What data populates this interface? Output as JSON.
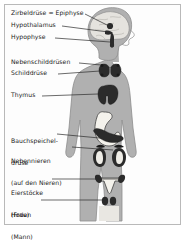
{
  "diagram": {
    "language": "de",
    "body_figure": "human-silhouette-front-with-head-in-profile",
    "colors": {
      "background": "#fdfdfd",
      "frame_border": "#b9b9b9",
      "body_fill": "#b0b0b0",
      "body_outline": "#8a8a8a",
      "organ_dark": "#2b2b2b",
      "organ_light": "#f2f0ea",
      "brain_fill": "#e3e1dc",
      "leader_line": "#2b2b2b",
      "text": "#1a1a1a"
    },
    "labels": [
      {
        "id": "pineal",
        "lines": [
          "Zirbeldrüse = Epiphyse"
        ],
        "organ": "Zirbeldrüse",
        "x": 11,
        "y": 11
      },
      {
        "id": "hypothalamus",
        "lines": [
          "Hypothalamus"
        ],
        "organ": "Hypothalamus",
        "x": 11,
        "y": 23
      },
      {
        "id": "pituitary",
        "lines": [
          "Hypophyse"
        ],
        "organ": "Hypophyse",
        "x": 11,
        "y": 35
      },
      {
        "id": "parathyroid",
        "lines": [
          "Nebenschilddrüsen"
        ],
        "organ": "Nebenschilddrüsen",
        "x": 11,
        "y": 60
      },
      {
        "id": "thyroid",
        "lines": [
          "Schilddrüse"
        ],
        "organ": "Schilddrüse",
        "x": 11,
        "y": 71
      },
      {
        "id": "thymus",
        "lines": [
          "Thymus"
        ],
        "organ": "Thymus",
        "x": 11,
        "y": 93
      },
      {
        "id": "pancreas",
        "lines": [
          "Bauchspeichel-",
          "drüse"
        ],
        "organ": "Bauchspeicheldrüse",
        "x": 11,
        "y": 124
      },
      {
        "id": "adrenal",
        "lines": [
          "Nebennieren",
          "(auf den Nieren)"
        ],
        "organ": "Nebennieren",
        "x": 11,
        "y": 144
      },
      {
        "id": "ovaries",
        "lines": [
          "Eierstöcke",
          "(Frau)"
        ],
        "organ": "Eierstöcke",
        "x": 11,
        "y": 176
      },
      {
        "id": "testes",
        "lines": [
          "Hoden",
          "(Mann)"
        ],
        "organ": "Hoden",
        "x": 11,
        "y": 198
      }
    ],
    "organs": [
      {
        "id": "pineal",
        "label": "Zirbeldrüse = Epiphyse",
        "region": "brain",
        "shade": "dark"
      },
      {
        "id": "hypothalamus",
        "label": "Hypothalamus",
        "region": "brain",
        "shade": "dark"
      },
      {
        "id": "pituitary",
        "label": "Hypophyse",
        "region": "brain",
        "shade": "dark"
      },
      {
        "id": "parathyroid",
        "label": "Nebenschilddrüsen",
        "region": "neck",
        "shade": "dark"
      },
      {
        "id": "thyroid",
        "label": "Schilddrüse",
        "region": "neck",
        "shade": "dark"
      },
      {
        "id": "thymus",
        "label": "Thymus",
        "region": "chest",
        "shade": "dark"
      },
      {
        "id": "stomach",
        "label": "Magen",
        "region": "abdomen",
        "shade": "light"
      },
      {
        "id": "pancreas",
        "label": "Bauchspeicheldrüse",
        "region": "abdomen",
        "shade": "dark"
      },
      {
        "id": "kidney-left",
        "label": "Niere",
        "region": "abdomen",
        "shade": "dark"
      },
      {
        "id": "kidney-right",
        "label": "Niere",
        "region": "abdomen",
        "shade": "dark"
      },
      {
        "id": "adrenal-left",
        "label": "Nebenniere",
        "region": "abdomen",
        "shade": "dark"
      },
      {
        "id": "adrenal-right",
        "label": "Nebenniere",
        "region": "abdomen",
        "shade": "dark"
      },
      {
        "id": "uterus",
        "label": "Gebärmutter",
        "region": "pelvis",
        "shade": "light"
      },
      {
        "id": "ovary-left",
        "label": "Eierstock",
        "region": "pelvis",
        "shade": "dark"
      },
      {
        "id": "ovary-right",
        "label": "Eierstock",
        "region": "pelvis",
        "shade": "dark"
      },
      {
        "id": "testis-left",
        "label": "Hoden",
        "region": "pelvis",
        "shade": "dark"
      },
      {
        "id": "testis-right",
        "label": "Hoden",
        "region": "pelvis",
        "shade": "dark"
      }
    ]
  }
}
